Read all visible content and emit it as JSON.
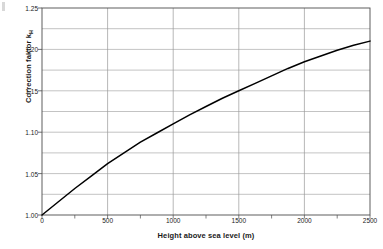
{
  "chart_data": {
    "type": "line",
    "title": "",
    "xlabel": "Height above sea level (m)",
    "ylabel": "Correction faktor k",
    "ylabel_subscript": "H",
    "xlim": [
      0,
      2500
    ],
    "ylim": [
      1.0,
      1.25
    ],
    "xticks": [
      0,
      500,
      1000,
      1500,
      2000,
      2500
    ],
    "xtick_labels": [
      "0",
      "500",
      "1000",
      "1500",
      "2000",
      "2500"
    ],
    "x_minor_tick_step": 250,
    "yticks": [
      1.0,
      1.05,
      1.1,
      1.15,
      1.2,
      1.25
    ],
    "ytick_labels": [
      "1.00",
      "1.05",
      "1.10",
      "1.15",
      "1.20",
      "1.25"
    ],
    "y_gridline_step": 0.025,
    "grid": true,
    "legend": null,
    "series": [
      {
        "name": "Correction faktor kH",
        "color": "#000000",
        "x": [
          0,
          125,
          250,
          375,
          500,
          625,
          750,
          875,
          1000,
          1125,
          1250,
          1375,
          1500,
          1625,
          1750,
          1875,
          2000,
          2125,
          2250,
          2375,
          2500
        ],
        "values": [
          1.0,
          1.016,
          1.032,
          1.047,
          1.062,
          1.075,
          1.088,
          1.099,
          1.11,
          1.121,
          1.131,
          1.141,
          1.15,
          1.159,
          1.168,
          1.177,
          1.185,
          1.192,
          1.199,
          1.205,
          1.21
        ]
      }
    ]
  },
  "axis_colors": {
    "grid": "#9a9a9a",
    "axis": "#4d4d4d",
    "curve": "#000000",
    "text": "#1a1a1a"
  }
}
